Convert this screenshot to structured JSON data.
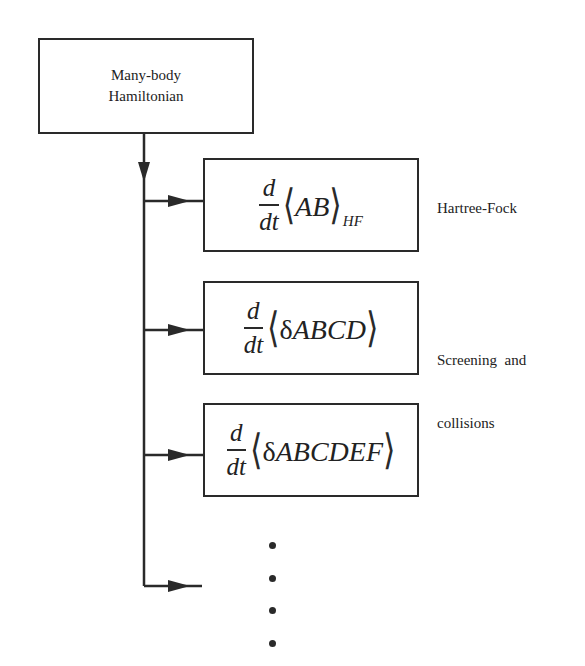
{
  "top_box": {
    "line1": "Many-body",
    "line2": "Hamiltonian"
  },
  "equations": [
    {
      "numerator": "d",
      "denominator": "dt",
      "left_bracket": "⟨",
      "delta": "",
      "vars": "AB",
      "right_bracket": "⟩",
      "subscript": "HF",
      "label_line1": "Hartree-Fock",
      "label_line2": ""
    },
    {
      "numerator": "d",
      "denominator": "dt",
      "left_bracket": "⟨",
      "delta": "δ",
      "vars": "ABCD",
      "right_bracket": "⟩",
      "subscript": "",
      "label_line1": "Screening  and",
      "label_line2": "collisions"
    },
    {
      "numerator": "d",
      "denominator": "dt",
      "left_bracket": "⟨",
      "delta": "δ",
      "vars": "ABCDEF",
      "right_bracket": "⟩",
      "subscript": "",
      "label_line1": "",
      "label_line2": ""
    }
  ],
  "continuation": {
    "symbol": "vertical-ellipsis",
    "dot_count": 4
  },
  "colors": {
    "line": "#2a2a2a",
    "background": "#ffffff"
  }
}
